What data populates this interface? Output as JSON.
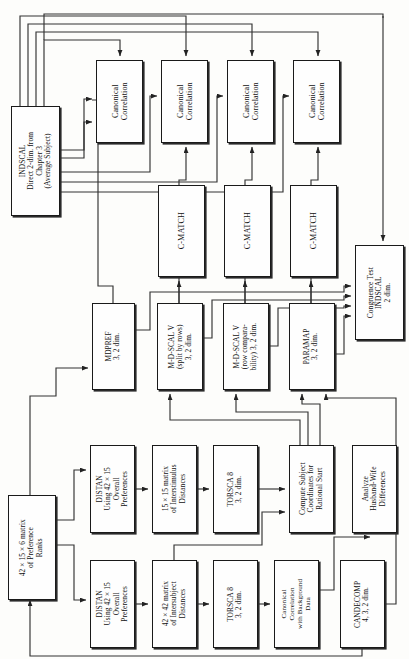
{
  "diagram": {
    "orientation": "rotated-90",
    "line_color": "#222222",
    "box_fill": "#fefefe",
    "box_border": "#1a1a1a",
    "nodes": [
      {
        "id": "indscal",
        "label": "INDSCAL\nDirect 2-dim. from\nChapter 3\n(Average Subject)",
        "x": 11,
        "y": 106,
        "w": 49,
        "h": 110,
        "size": "sm"
      },
      {
        "id": "canon1",
        "label": "Canonical\nCorrelation",
        "x": 96,
        "y": 60,
        "w": 47,
        "h": 83,
        "size": "md"
      },
      {
        "id": "canon2",
        "label": "Canonical\nCorrelation",
        "x": 161,
        "y": 60,
        "w": 47,
        "h": 83,
        "size": "md"
      },
      {
        "id": "canon3",
        "label": "Canonical\nCorrelation",
        "x": 227,
        "y": 60,
        "w": 47,
        "h": 83,
        "size": "md"
      },
      {
        "id": "canon4",
        "label": "Canonical\nCorrelation",
        "x": 293,
        "y": 60,
        "w": 47,
        "h": 83,
        "size": "md"
      },
      {
        "id": "cmatch1",
        "label": "C-MATCH",
        "x": 158,
        "y": 185,
        "w": 47,
        "h": 92,
        "size": "md"
      },
      {
        "id": "cmatch2",
        "label": "C-MATCH",
        "x": 224,
        "y": 185,
        "w": 47,
        "h": 92,
        "size": "md"
      },
      {
        "id": "cmatch3",
        "label": "C-MATCH",
        "x": 290,
        "y": 185,
        "w": 47,
        "h": 92,
        "size": "md"
      },
      {
        "id": "congruence",
        "label": "Congruence Test\nINDSCAL\n2 dim.",
        "x": 355,
        "y": 245,
        "w": 49,
        "h": 95,
        "size": "sm"
      },
      {
        "id": "mdpref",
        "label": "MDPREF\n3, 2 dim.",
        "x": 92,
        "y": 303,
        "w": 43,
        "h": 87,
        "size": "sm"
      },
      {
        "id": "mdscal_split",
        "label": "M-D-SCAL V\n(split by rows)\n3, 2 dim.",
        "x": 157,
        "y": 303,
        "w": 46,
        "h": 87,
        "size": "sm"
      },
      {
        "id": "mdscal_row",
        "label": "M-D-SCAL V\n(row compara-\nbility) 3, 2 dim.",
        "x": 223,
        "y": 303,
        "w": 46,
        "h": 87,
        "size": "sm"
      },
      {
        "id": "paramap",
        "label": "PARAMAP\n3, 2 dim.",
        "x": 289,
        "y": 303,
        "w": 46,
        "h": 87,
        "size": "sm"
      },
      {
        "id": "prefranks",
        "label": "42 × 15 × 6 matrix\nof Preference\nRanks",
        "x": 8,
        "y": 495,
        "w": 48,
        "h": 105,
        "size": "sm"
      },
      {
        "id": "distan1",
        "label": "DISTAN\nUsing 42 × 15\nOverall\nPreferences",
        "x": 90,
        "y": 445,
        "w": 45,
        "h": 88,
        "size": "sm"
      },
      {
        "id": "inter15",
        "label": "15 × 15 matrix\nof Interstimulus\nDistances",
        "x": 152,
        "y": 445,
        "w": 45,
        "h": 88,
        "size": "sm"
      },
      {
        "id": "torsca1",
        "label": "TORSCA 8\n3, 2 dim.",
        "x": 213,
        "y": 445,
        "w": 45,
        "h": 88,
        "size": "sm"
      },
      {
        "id": "compute",
        "label": "Compute Subject\nCoordinates for\nRational Start",
        "x": 289,
        "y": 445,
        "w": 45,
        "h": 88,
        "size": "sm"
      },
      {
        "id": "analyze",
        "label": "Analyze\nHusband-Wife\nDifferences",
        "x": 352,
        "y": 445,
        "w": 45,
        "h": 88,
        "size": "sm"
      },
      {
        "id": "distan2",
        "label": "DISTAN\nUsing 42 × 15\nOverall\nPreferences",
        "x": 90,
        "y": 560,
        "w": 45,
        "h": 88,
        "size": "sm"
      },
      {
        "id": "inter42",
        "label": "42 × 42 matrix\nof Intersubject\nDistances",
        "x": 152,
        "y": 560,
        "w": 45,
        "h": 88,
        "size": "sm"
      },
      {
        "id": "torsca2",
        "label": "TORSCA 8\n3, 2 dim.",
        "x": 213,
        "y": 560,
        "w": 45,
        "h": 88,
        "size": "sm"
      },
      {
        "id": "canonbg",
        "label": "Canonical\nCorrelation\nwith Background\nData",
        "x": 274,
        "y": 560,
        "w": 45,
        "h": 88,
        "size": "xs"
      },
      {
        "id": "candecomp",
        "label": "CANDECOMP\n4, 3, 2 dim.",
        "x": 340,
        "y": 560,
        "w": 45,
        "h": 88,
        "size": "sm"
      }
    ],
    "edges": [
      {
        "from": "indscal",
        "to": "canon1"
      },
      {
        "from": "indscal",
        "to": "canon2"
      },
      {
        "from": "indscal",
        "to": "canon3"
      },
      {
        "from": "indscal",
        "to": "canon4"
      },
      {
        "from": "indscal",
        "to": "cmatch1"
      },
      {
        "from": "indscal",
        "to": "cmatch2"
      },
      {
        "from": "indscal",
        "to": "cmatch3"
      },
      {
        "from": "indscal",
        "to": "congruence"
      },
      {
        "from": "mdpref",
        "to": "canon1"
      },
      {
        "from": "mdscal_split",
        "to": "canon2"
      },
      {
        "from": "mdscal_split",
        "to": "cmatch1"
      },
      {
        "from": "mdscal_row",
        "to": "canon3"
      },
      {
        "from": "mdscal_row",
        "to": "cmatch2"
      },
      {
        "from": "paramap",
        "to": "canon4"
      },
      {
        "from": "paramap",
        "to": "cmatch3"
      },
      {
        "from": "mdpref",
        "to": "congruence"
      },
      {
        "from": "mdscal_split",
        "to": "congruence"
      },
      {
        "from": "mdscal_row",
        "to": "congruence"
      },
      {
        "from": "paramap",
        "to": "congruence"
      },
      {
        "from": "prefranks",
        "to": "mdpref"
      },
      {
        "from": "prefranks",
        "to": "distan1"
      },
      {
        "from": "prefranks",
        "to": "distan2"
      },
      {
        "from": "distan1",
        "to": "inter15"
      },
      {
        "from": "inter15",
        "to": "torsca1"
      },
      {
        "from": "torsca1",
        "to": "compute"
      },
      {
        "from": "compute",
        "to": "mdscal_split"
      },
      {
        "from": "compute",
        "to": "mdscal_row"
      },
      {
        "from": "compute",
        "to": "paramap"
      },
      {
        "from": "distan2",
        "to": "inter42"
      },
      {
        "from": "inter42",
        "to": "torsca2"
      },
      {
        "from": "torsca2",
        "to": "canonbg"
      },
      {
        "from": "inter42",
        "to": "compute"
      },
      {
        "from": "canonbg",
        "to": "analyze"
      },
      {
        "from": "prefranks",
        "to": "candecomp"
      },
      {
        "from": "candecomp",
        "to": "paramap"
      }
    ]
  }
}
